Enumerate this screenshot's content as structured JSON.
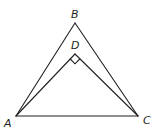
{
  "diagram": {
    "type": "geometry",
    "points": {
      "A": {
        "label": "A",
        "x": 16,
        "y": 116
      },
      "B": {
        "label": "B",
        "x": 75,
        "y": 23
      },
      "C": {
        "label": "C",
        "x": 138,
        "y": 116
      },
      "D": {
        "label": "D",
        "x": 75,
        "y": 54
      }
    },
    "segments": [
      "AB",
      "BC",
      "CA",
      "AD",
      "DC"
    ],
    "right_angle_at": "D",
    "stroke_color": "#231f20"
  }
}
